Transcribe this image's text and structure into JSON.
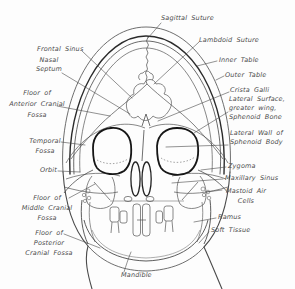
{
  "figure": {
    "background_color": "#fdfdfd",
    "line_color": "#4a4a4a",
    "heavy_line_color": "#1e1e1e",
    "text_color": "#4a4a4a"
  },
  "labels": {
    "sagittal_suture": {
      "text": "Sagittal Suture"
    },
    "lambdoid_suture": {
      "text": "Lambdoid Suture"
    },
    "inner_table": {
      "text": "Inner Table"
    },
    "outer_table": {
      "text": "Outer Table"
    },
    "crista_galli": {
      "text": "Crista Galli"
    },
    "sphenoid_wing": {
      "lines": [
        "Lateral Surface,",
        "greater wing,",
        "Sphenoid Bone"
      ]
    },
    "lateral_wall": {
      "lines": [
        "Lateral Wall of",
        "Sphenoid Body"
      ]
    },
    "zygoma": {
      "text": "Zygoma"
    },
    "maxillary_sinus": {
      "text": "Maxillary Sinus"
    },
    "mastoid_air_cells": {
      "lines": [
        "Mastoid Air",
        "Cells"
      ]
    },
    "ramus": {
      "text": "Ramus"
    },
    "soft_tissue": {
      "text": "Soft Tissue"
    },
    "frontal_sinus": {
      "text": "Frontal Sinus"
    },
    "nasal_septum": {
      "lines": [
        "Nasal",
        "Septum"
      ]
    },
    "floor_anterior": {
      "lines": [
        "Floor of",
        "Anterior Cranial",
        "Fossa"
      ]
    },
    "temporal_fossa": {
      "lines": [
        "Temporal",
        "Fossa"
      ]
    },
    "orbit": {
      "text": "Orbit"
    },
    "floor_middle": {
      "lines": [
        "Floor of",
        "Middle Cranial",
        "Fossa"
      ]
    },
    "floor_posterior": {
      "lines": [
        "Floor of",
        "Posterior",
        "Cranial Fossa"
      ]
    },
    "mandible": {
      "text": "Mandible"
    }
  }
}
